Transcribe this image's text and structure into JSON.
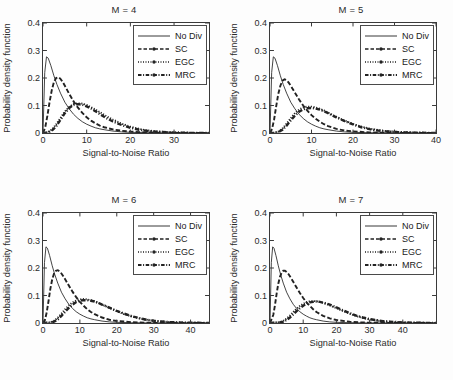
{
  "figure": {
    "background": "#fdfdfd",
    "axis_color": "#3a3a3a",
    "text_color": "#2b2b2b"
  },
  "chart_data": [
    {
      "type": "line",
      "title": "M = 4",
      "xlabel": "Signal-to-Noise Ratio",
      "ylabel": "Probability density function",
      "xlim": [
        0,
        38
      ],
      "ylim": [
        0,
        0.4
      ],
      "xticks": [
        0,
        10,
        20,
        30
      ],
      "yticks": [
        0,
        0.1,
        0.2,
        0.3,
        0.4
      ],
      "xticklabels": [
        "0",
        "10",
        "20",
        "30"
      ],
      "yticklabels": [
        "0",
        "0.1",
        "0.2",
        "0.3",
        "0.4"
      ],
      "grid": false,
      "legend_position": "top-right",
      "series": [
        {
          "name": "No Div",
          "style": "solid-thin",
          "x": [
            0,
            0.4,
            0.8,
            1.2,
            1.8,
            2.5,
            3.2,
            4,
            5,
            6,
            7,
            8,
            9,
            10,
            11,
            12,
            13,
            14,
            16,
            18,
            20,
            24,
            28,
            32,
            38
          ],
          "y": [
            0.0,
            0.22,
            0.277,
            0.272,
            0.245,
            0.208,
            0.176,
            0.145,
            0.112,
            0.088,
            0.068,
            0.053,
            0.041,
            0.032,
            0.025,
            0.019,
            0.015,
            0.012,
            0.007,
            0.004,
            0.0025,
            0.001,
            0.0004,
            0.0002,
            0.0
          ]
        },
        {
          "name": "SC",
          "style": "dashed",
          "x": [
            0,
            0.5,
            1,
            1.5,
            2,
            2.5,
            3,
            3.5,
            4,
            4.5,
            5,
            6,
            7,
            8,
            9,
            10,
            11,
            12,
            13,
            14,
            16,
            18,
            20,
            24,
            28,
            32,
            38
          ],
          "y": [
            0.0,
            0.02,
            0.062,
            0.112,
            0.155,
            0.185,
            0.2,
            0.203,
            0.197,
            0.186,
            0.172,
            0.142,
            0.115,
            0.092,
            0.073,
            0.057,
            0.045,
            0.035,
            0.027,
            0.021,
            0.013,
            0.008,
            0.005,
            0.002,
            0.0008,
            0.0003,
            0.0
          ]
        },
        {
          "name": "EGC",
          "style": "dotted",
          "x": [
            0,
            1,
            2,
            3,
            4,
            5,
            6,
            7,
            8,
            9,
            10,
            11,
            12,
            13,
            14,
            15,
            16,
            18,
            20,
            22,
            24,
            26,
            30,
            34,
            38
          ],
          "y": [
            0.0,
            0.002,
            0.012,
            0.031,
            0.055,
            0.078,
            0.095,
            0.105,
            0.108,
            0.107,
            0.102,
            0.094,
            0.085,
            0.076,
            0.066,
            0.057,
            0.049,
            0.034,
            0.023,
            0.015,
            0.009,
            0.006,
            0.002,
            0.0006,
            0.0
          ]
        },
        {
          "name": "MRC",
          "style": "dashdot-thick",
          "x": [
            0,
            1,
            2,
            3,
            4,
            5,
            6,
            7,
            8,
            9,
            10,
            11,
            12,
            13,
            14,
            15,
            16,
            18,
            20,
            22,
            24,
            26,
            30,
            34,
            38
          ],
          "y": [
            0.0,
            0.001,
            0.008,
            0.024,
            0.048,
            0.072,
            0.091,
            0.102,
            0.105,
            0.103,
            0.097,
            0.089,
            0.079,
            0.069,
            0.059,
            0.05,
            0.042,
            0.029,
            0.019,
            0.012,
            0.0075,
            0.0045,
            0.0015,
            0.0005,
            0.0
          ]
        }
      ]
    },
    {
      "type": "line",
      "title": "M = 5",
      "xlabel": "Signal-to-Noise Ratio",
      "ylabel": "Probability density function",
      "xlim": [
        0,
        40
      ],
      "ylim": [
        0,
        0.4
      ],
      "xticks": [
        0,
        10,
        20,
        30,
        40
      ],
      "yticks": [
        0,
        0.1,
        0.2,
        0.3,
        0.4
      ],
      "xticklabels": [
        "0",
        "10",
        "20",
        "30",
        "40"
      ],
      "yticklabels": [
        "0",
        "0.1",
        "0.2",
        "0.3",
        "0.4"
      ],
      "grid": false,
      "legend_position": "top-right",
      "series": [
        {
          "name": "No Div",
          "style": "solid-thin",
          "x": [
            0,
            0.4,
            0.8,
            1.2,
            1.8,
            2.5,
            3.2,
            4,
            5,
            6,
            7,
            8,
            9,
            10,
            11,
            12,
            13,
            14,
            16,
            18,
            20,
            24,
            28,
            32,
            40
          ],
          "y": [
            0.0,
            0.22,
            0.277,
            0.272,
            0.245,
            0.208,
            0.176,
            0.145,
            0.112,
            0.088,
            0.068,
            0.053,
            0.041,
            0.032,
            0.025,
            0.019,
            0.015,
            0.012,
            0.007,
            0.004,
            0.0025,
            0.001,
            0.0004,
            0.0002,
            0.0
          ]
        },
        {
          "name": "SC",
          "style": "dashed",
          "x": [
            0,
            0.5,
            1,
            1.5,
            2,
            2.5,
            3,
            3.5,
            4,
            4.5,
            5,
            6,
            7,
            8,
            9,
            10,
            11,
            12,
            13,
            14,
            16,
            18,
            20,
            24,
            28,
            34,
            40
          ],
          "y": [
            0.0,
            0.015,
            0.05,
            0.098,
            0.142,
            0.172,
            0.19,
            0.195,
            0.192,
            0.183,
            0.172,
            0.147,
            0.122,
            0.1,
            0.081,
            0.065,
            0.052,
            0.041,
            0.032,
            0.025,
            0.015,
            0.009,
            0.006,
            0.002,
            0.0008,
            0.0002,
            0.0
          ]
        },
        {
          "name": "EGC",
          "style": "dotted",
          "x": [
            0,
            1,
            2,
            3,
            4,
            5,
            6,
            7,
            8,
            9,
            10,
            11,
            12,
            13,
            14,
            15,
            16,
            18,
            20,
            22,
            24,
            26,
            28,
            32,
            36,
            40
          ],
          "y": [
            0.0,
            0.0005,
            0.005,
            0.016,
            0.034,
            0.054,
            0.072,
            0.085,
            0.093,
            0.096,
            0.096,
            0.093,
            0.088,
            0.082,
            0.074,
            0.066,
            0.059,
            0.045,
            0.033,
            0.023,
            0.016,
            0.011,
            0.007,
            0.003,
            0.001,
            0.0
          ]
        },
        {
          "name": "MRC",
          "style": "dashdot-thick",
          "x": [
            0,
            1,
            2,
            3,
            4,
            5,
            6,
            7,
            8,
            9,
            10,
            11,
            12,
            13,
            14,
            15,
            16,
            18,
            20,
            22,
            24,
            26,
            28,
            32,
            36,
            40
          ],
          "y": [
            0.0,
            0.0003,
            0.003,
            0.012,
            0.027,
            0.046,
            0.063,
            0.077,
            0.086,
            0.09,
            0.091,
            0.089,
            0.085,
            0.079,
            0.072,
            0.064,
            0.057,
            0.043,
            0.031,
            0.021,
            0.014,
            0.009,
            0.006,
            0.0025,
            0.0008,
            0.0
          ]
        }
      ]
    },
    {
      "type": "line",
      "title": "M = 6",
      "xlabel": "Signal-to-Noise Ratio",
      "ylabel": "Probability density function",
      "xlim": [
        0,
        45
      ],
      "ylim": [
        0,
        0.4
      ],
      "xticks": [
        0,
        10,
        20,
        30,
        40
      ],
      "yticks": [
        0,
        0.1,
        0.2,
        0.3,
        0.4
      ],
      "xticklabels": [
        "0",
        "10",
        "20",
        "30",
        "40"
      ],
      "yticklabels": [
        "0",
        "0.1",
        "0.2",
        "0.3",
        "0.4"
      ],
      "grid": false,
      "legend_position": "top-right",
      "series": [
        {
          "name": "No Div",
          "style": "solid-thin",
          "x": [
            0,
            0.4,
            0.8,
            1.2,
            1.8,
            2.5,
            3.2,
            4,
            5,
            6,
            7,
            8,
            9,
            10,
            11,
            12,
            13,
            14,
            16,
            18,
            20,
            24,
            28,
            34,
            45
          ],
          "y": [
            0.0,
            0.22,
            0.277,
            0.272,
            0.245,
            0.208,
            0.176,
            0.145,
            0.112,
            0.088,
            0.068,
            0.053,
            0.041,
            0.032,
            0.025,
            0.019,
            0.015,
            0.012,
            0.007,
            0.004,
            0.0025,
            0.001,
            0.0004,
            0.0001,
            0.0
          ]
        },
        {
          "name": "SC",
          "style": "dashed",
          "x": [
            0,
            0.5,
            1,
            1.5,
            2,
            2.5,
            3,
            3.5,
            4,
            4.5,
            5,
            5.5,
            6,
            7,
            8,
            9,
            10,
            11,
            12,
            13,
            14,
            16,
            18,
            20,
            24,
            28,
            34,
            45
          ],
          "y": [
            0.0,
            0.01,
            0.038,
            0.08,
            0.125,
            0.159,
            0.18,
            0.19,
            0.192,
            0.188,
            0.18,
            0.17,
            0.159,
            0.136,
            0.114,
            0.094,
            0.077,
            0.063,
            0.05,
            0.04,
            0.032,
            0.02,
            0.012,
            0.0075,
            0.003,
            0.001,
            0.0003,
            0.0
          ]
        },
        {
          "name": "EGC",
          "style": "dotted",
          "x": [
            0,
            2,
            3,
            4,
            5,
            6,
            7,
            8,
            9,
            10,
            11,
            12,
            13,
            14,
            15,
            16,
            18,
            20,
            22,
            24,
            26,
            28,
            30,
            34,
            38,
            45
          ],
          "y": [
            0.0,
            0.002,
            0.008,
            0.019,
            0.034,
            0.05,
            0.064,
            0.075,
            0.082,
            0.086,
            0.087,
            0.086,
            0.083,
            0.079,
            0.073,
            0.067,
            0.055,
            0.043,
            0.032,
            0.024,
            0.017,
            0.012,
            0.008,
            0.0035,
            0.0015,
            0.0
          ]
        },
        {
          "name": "MRC",
          "style": "dashdot-thick",
          "x": [
            0,
            2,
            3,
            4,
            5,
            6,
            7,
            8,
            9,
            10,
            11,
            12,
            13,
            14,
            15,
            16,
            18,
            20,
            22,
            24,
            26,
            28,
            30,
            34,
            38,
            45
          ],
          "y": [
            0.0,
            0.0012,
            0.005,
            0.013,
            0.026,
            0.041,
            0.055,
            0.067,
            0.076,
            0.081,
            0.083,
            0.083,
            0.081,
            0.078,
            0.073,
            0.067,
            0.056,
            0.044,
            0.034,
            0.025,
            0.018,
            0.012,
            0.008,
            0.0035,
            0.0015,
            0.0
          ]
        }
      ]
    },
    {
      "type": "line",
      "title": "M = 7",
      "xlabel": "Signal-to-Noise Ratio",
      "ylabel": "Probability density function",
      "xlim": [
        0,
        50
      ],
      "ylim": [
        0,
        0.4
      ],
      "xticks": [
        0,
        10,
        20,
        30,
        40
      ],
      "yticks": [
        0,
        0.1,
        0.2,
        0.3,
        0.4
      ],
      "xticklabels": [
        "0",
        "10",
        "20",
        "30",
        "40"
      ],
      "yticklabels": [
        "0",
        "0.1",
        "0.2",
        "0.3",
        "0.4"
      ],
      "grid": false,
      "legend_position": "top-right",
      "series": [
        {
          "name": "No Div",
          "style": "solid-thin",
          "x": [
            0,
            0.4,
            0.8,
            1.2,
            1.8,
            2.5,
            3.2,
            4,
            5,
            6,
            7,
            8,
            9,
            10,
            11,
            12,
            13,
            14,
            16,
            18,
            20,
            24,
            28,
            34,
            50
          ],
          "y": [
            0.0,
            0.22,
            0.277,
            0.272,
            0.245,
            0.208,
            0.176,
            0.145,
            0.112,
            0.088,
            0.068,
            0.053,
            0.041,
            0.032,
            0.025,
            0.019,
            0.015,
            0.012,
            0.007,
            0.004,
            0.0025,
            0.001,
            0.0004,
            0.0001,
            0.0
          ]
        },
        {
          "name": "SC",
          "style": "dashed",
          "x": [
            0,
            1,
            1.5,
            2,
            2.5,
            3,
            3.5,
            4,
            4.5,
            5,
            5.5,
            6,
            7,
            8,
            9,
            10,
            11,
            12,
            13,
            14,
            16,
            18,
            20,
            24,
            28,
            34,
            50
          ],
          "y": [
            0.0,
            0.03,
            0.065,
            0.107,
            0.143,
            0.168,
            0.183,
            0.19,
            0.19,
            0.186,
            0.179,
            0.17,
            0.15,
            0.129,
            0.109,
            0.091,
            0.075,
            0.062,
            0.05,
            0.04,
            0.026,
            0.017,
            0.011,
            0.0045,
            0.0018,
            0.0005,
            0.0
          ]
        },
        {
          "name": "EGC",
          "style": "dotted",
          "x": [
            0,
            3,
            4,
            5,
            6,
            7,
            8,
            9,
            10,
            11,
            12,
            13,
            14,
            15,
            16,
            17,
            18,
            20,
            22,
            24,
            26,
            28,
            30,
            34,
            40,
            50
          ],
          "y": [
            0.0,
            0.003,
            0.008,
            0.016,
            0.027,
            0.04,
            0.052,
            0.062,
            0.07,
            0.076,
            0.079,
            0.08,
            0.079,
            0.077,
            0.073,
            0.069,
            0.064,
            0.054,
            0.043,
            0.034,
            0.025,
            0.018,
            0.013,
            0.006,
            0.0018,
            0.0
          ]
        },
        {
          "name": "MRC",
          "style": "dashdot-thick",
          "x": [
            0,
            3,
            4,
            5,
            6,
            7,
            8,
            9,
            10,
            11,
            12,
            13,
            14,
            15,
            16,
            17,
            18,
            20,
            22,
            24,
            26,
            28,
            30,
            34,
            40,
            50
          ],
          "y": [
            0.0,
            0.002,
            0.005,
            0.011,
            0.02,
            0.031,
            0.043,
            0.054,
            0.063,
            0.07,
            0.075,
            0.077,
            0.078,
            0.077,
            0.074,
            0.071,
            0.067,
            0.057,
            0.046,
            0.036,
            0.027,
            0.02,
            0.014,
            0.0065,
            0.002,
            0.0
          ]
        }
      ]
    }
  ]
}
